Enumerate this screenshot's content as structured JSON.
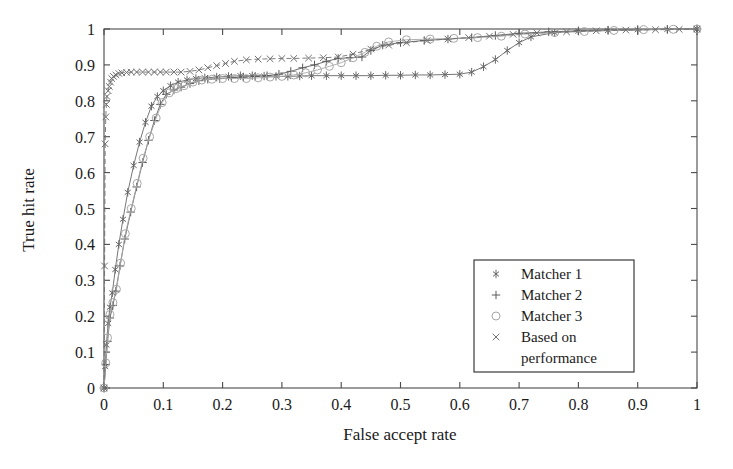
{
  "chart_data": {
    "type": "line",
    "title": "",
    "xlabel": "False accept rate",
    "ylabel": "True hit rate",
    "xlim": [
      0,
      1
    ],
    "ylim": [
      0,
      1
    ],
    "grid": false,
    "legend_position": "lower-right",
    "xticks": [
      "0",
      "0.1",
      "0.2",
      "0.3",
      "0.4",
      "0.5",
      "0.6",
      "0.7",
      "0.8",
      "0.9",
      "1"
    ],
    "xtick_values": [
      0,
      0.1,
      0.2,
      0.3,
      0.4,
      0.5,
      0.6,
      0.7,
      0.8,
      0.9,
      1
    ],
    "yticks": [
      "0",
      "0.1",
      "0.2",
      "0.3",
      "0.4",
      "0.5",
      "0.6",
      "0.7",
      "0.8",
      "0.9",
      "1"
    ],
    "ytick_values": [
      0,
      0.1,
      0.2,
      0.3,
      0.4,
      0.5,
      0.6,
      0.7,
      0.8,
      0.9,
      1
    ],
    "series": [
      {
        "name": "Matcher 1",
        "marker": "asterisk",
        "color": "#666666",
        "x": [
          0.0,
          0.002,
          0.004,
          0.007,
          0.01,
          0.014,
          0.019,
          0.025,
          0.032,
          0.04,
          0.05,
          0.06,
          0.07,
          0.08,
          0.09,
          0.1,
          0.112,
          0.125,
          0.14,
          0.155,
          0.17,
          0.19,
          0.21,
          0.23,
          0.25,
          0.27,
          0.29,
          0.31,
          0.33,
          0.35,
          0.375,
          0.4,
          0.425,
          0.45,
          0.475,
          0.5,
          0.525,
          0.55,
          0.575,
          0.6,
          0.62,
          0.64,
          0.66,
          0.68,
          0.7,
          0.72,
          0.76,
          0.8,
          0.85,
          0.9,
          0.95,
          1.0
        ],
        "y": [
          0.0,
          0.06,
          0.12,
          0.18,
          0.225,
          0.265,
          0.33,
          0.4,
          0.47,
          0.545,
          0.62,
          0.685,
          0.74,
          0.785,
          0.812,
          0.828,
          0.842,
          0.852,
          0.858,
          0.862,
          0.864,
          0.866,
          0.868,
          0.87,
          0.87,
          0.869,
          0.868,
          0.868,
          0.869,
          0.87,
          0.87,
          0.87,
          0.87,
          0.87,
          0.871,
          0.871,
          0.872,
          0.872,
          0.873,
          0.874,
          0.88,
          0.895,
          0.915,
          0.94,
          0.962,
          0.978,
          0.99,
          0.994,
          0.996,
          0.998,
          0.999,
          1.0
        ]
      },
      {
        "name": "Matcher 2",
        "marker": "plus",
        "color": "#5a5a5a",
        "x": [
          0.0,
          0.003,
          0.006,
          0.01,
          0.015,
          0.02,
          0.027,
          0.035,
          0.045,
          0.055,
          0.065,
          0.075,
          0.085,
          0.095,
          0.105,
          0.118,
          0.13,
          0.145,
          0.16,
          0.175,
          0.195,
          0.215,
          0.235,
          0.255,
          0.275,
          0.295,
          0.315,
          0.335,
          0.355,
          0.375,
          0.395,
          0.415,
          0.435,
          0.45,
          0.47,
          0.5,
          0.54,
          0.58,
          0.62,
          0.66,
          0.7,
          0.75,
          0.8,
          0.85,
          0.9,
          0.95,
          1.0
        ],
        "y": [
          0.0,
          0.065,
          0.13,
          0.195,
          0.23,
          0.27,
          0.34,
          0.415,
          0.49,
          0.56,
          0.628,
          0.69,
          0.745,
          0.79,
          0.818,
          0.83,
          0.838,
          0.848,
          0.856,
          0.86,
          0.862,
          0.864,
          0.866,
          0.868,
          0.87,
          0.874,
          0.882,
          0.892,
          0.9,
          0.91,
          0.918,
          0.92,
          0.922,
          0.94,
          0.955,
          0.962,
          0.968,
          0.972,
          0.976,
          0.982,
          0.988,
          0.992,
          0.995,
          0.997,
          0.998,
          0.999,
          1.0
        ]
      },
      {
        "name": "Matcher 3",
        "marker": "circle",
        "color": "#a8a8a8",
        "x": [
          0.0,
          0.003,
          0.006,
          0.01,
          0.015,
          0.021,
          0.028,
          0.036,
          0.046,
          0.056,
          0.066,
          0.077,
          0.088,
          0.098,
          0.11,
          0.122,
          0.135,
          0.15,
          0.165,
          0.182,
          0.2,
          0.22,
          0.24,
          0.26,
          0.28,
          0.3,
          0.32,
          0.34,
          0.36,
          0.38,
          0.4,
          0.42,
          0.44,
          0.46,
          0.48,
          0.51,
          0.55,
          0.59,
          0.63,
          0.67,
          0.71,
          0.76,
          0.81,
          0.86,
          0.91,
          0.96,
          1.0
        ],
        "y": [
          0.0,
          0.07,
          0.14,
          0.205,
          0.238,
          0.275,
          0.348,
          0.43,
          0.5,
          0.57,
          0.64,
          0.7,
          0.752,
          0.795,
          0.822,
          0.834,
          0.842,
          0.852,
          0.858,
          0.86,
          0.862,
          0.862,
          0.862,
          0.864,
          0.866,
          0.868,
          0.872,
          0.878,
          0.886,
          0.896,
          0.906,
          0.92,
          0.935,
          0.952,
          0.964,
          0.97,
          0.972,
          0.974,
          0.976,
          0.98,
          0.986,
          0.99,
          0.993,
          0.996,
          0.998,
          0.999,
          1.0
        ]
      },
      {
        "name": "Based on performance",
        "marker": "cross",
        "color": "#707070",
        "x": [
          0.0,
          0.001,
          0.002,
          0.003,
          0.004,
          0.005,
          0.007,
          0.009,
          0.011,
          0.013,
          0.016,
          0.02,
          0.025,
          0.03,
          0.038,
          0.046,
          0.055,
          0.065,
          0.075,
          0.085,
          0.095,
          0.105,
          0.118,
          0.13,
          0.145,
          0.16,
          0.175,
          0.19,
          0.205,
          0.22,
          0.24,
          0.26,
          0.28,
          0.3,
          0.32,
          0.345,
          0.37,
          0.395,
          0.42,
          0.45,
          0.48,
          0.51,
          0.545,
          0.58,
          0.615,
          0.65,
          0.69,
          0.73,
          0.78,
          0.83,
          0.88,
          0.93,
          0.97,
          1.0
        ],
        "y": [
          0.0,
          0.34,
          0.68,
          0.755,
          0.79,
          0.812,
          0.828,
          0.84,
          0.852,
          0.862,
          0.868,
          0.872,
          0.876,
          0.878,
          0.879,
          0.88,
          0.88,
          0.88,
          0.88,
          0.88,
          0.88,
          0.88,
          0.88,
          0.88,
          0.882,
          0.886,
          0.892,
          0.898,
          0.904,
          0.91,
          0.914,
          0.916,
          0.917,
          0.918,
          0.918,
          0.919,
          0.92,
          0.922,
          0.93,
          0.944,
          0.955,
          0.962,
          0.968,
          0.972,
          0.976,
          0.98,
          0.985,
          0.989,
          0.992,
          0.995,
          0.997,
          0.998,
          0.999,
          1.0
        ]
      }
    ]
  },
  "legend": {
    "entries": [
      {
        "label": "Matcher 1",
        "marker": "asterisk"
      },
      {
        "label": "Matcher 2",
        "marker": "plus"
      },
      {
        "label": "Matcher 3",
        "marker": "circle"
      },
      {
        "label": "Based on",
        "marker": "cross"
      },
      {
        "label": "performance",
        "marker": "none"
      }
    ]
  }
}
